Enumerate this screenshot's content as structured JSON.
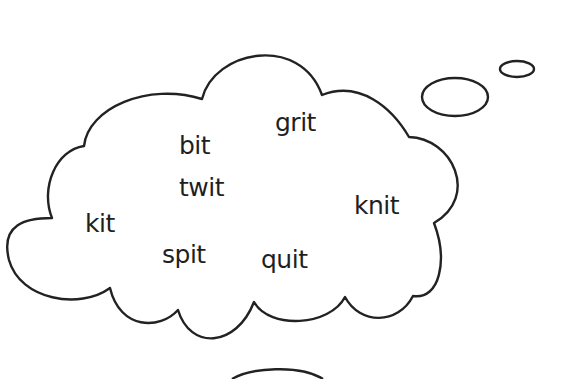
{
  "cloud": {
    "words": [
      {
        "text": "grit",
        "x": 275,
        "y": 110
      },
      {
        "text": "bit",
        "x": 179,
        "y": 133
      },
      {
        "text": "twit",
        "x": 179,
        "y": 175
      },
      {
        "text": "knit",
        "x": 354,
        "y": 193
      },
      {
        "text": "kit",
        "x": 85,
        "y": 211
      },
      {
        "text": "spit",
        "x": 162,
        "y": 242
      },
      {
        "text": "quit",
        "x": 261,
        "y": 247
      }
    ],
    "stroke_color": "#222222"
  }
}
